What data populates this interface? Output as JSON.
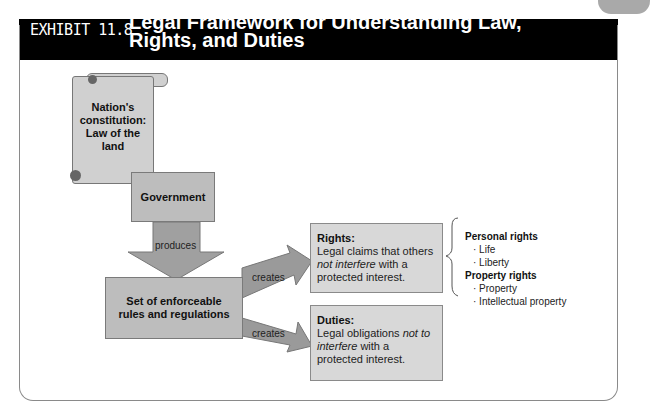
{
  "header": {
    "exhibit_label": "EXHIBIT 11.8",
    "title": "Legal Framework for Understanding Law, Rights, and Duties"
  },
  "diagram": {
    "constitution": {
      "line1": "Nation's",
      "line2": "constitution:",
      "line3": "Law of the",
      "line4": "land"
    },
    "government": "Government",
    "produces_label": "produces",
    "rules": {
      "line1": "Set of enforceable",
      "line2": "rules and regulations"
    },
    "creates_top": "creates",
    "creates_bottom": "creates",
    "rights": {
      "heading": "Rights:",
      "text_before": "Legal claims that others ",
      "text_italic": "not interfere",
      "text_after": " with a protected interest."
    },
    "duties": {
      "heading": "Duties:",
      "text_before": "Legal obligations ",
      "text_italic": "not to interfere",
      "text_after": " with a protected interest."
    },
    "rights_types": {
      "personal_heading": "Personal rights",
      "personal_items": [
        "· Life",
        "· Liberty"
      ],
      "property_heading": "Property rights",
      "property_items": [
        "· Property",
        "· Intellectual property"
      ]
    }
  },
  "colors": {
    "header_bg": "#000000",
    "box_fill": "#bdbdbd",
    "arrow_fill": "#999999"
  }
}
